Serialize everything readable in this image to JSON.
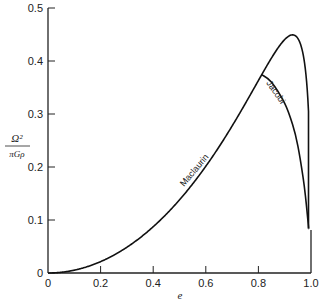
{
  "chart_data": {
    "type": "line",
    "title": "",
    "xlabel": "e",
    "ylabel": "Ω² / πGρ",
    "xlim": [
      0,
      1.0
    ],
    "ylim": [
      0,
      0.5
    ],
    "x_ticks": [
      "0",
      "0.2",
      "0.4",
      "0.6",
      "0.8",
      "1.0"
    ],
    "y_ticks": [
      "0",
      "0.1",
      "0.2",
      "0.3",
      "0.4",
      "0.5"
    ],
    "grid": false,
    "legend": "none (inline curve labels)",
    "series": [
      {
        "name": "Maclaurin",
        "x": [
          0,
          0.1,
          0.2,
          0.3,
          0.4,
          0.5,
          0.6,
          0.7,
          0.8,
          0.85,
          0.9,
          0.93,
          0.95,
          0.97,
          0.98,
          0.99
        ],
        "values": [
          0,
          0.0027,
          0.0108,
          0.0245,
          0.0445,
          0.0713,
          0.1068,
          0.1539,
          0.2178,
          0.363,
          0.4146,
          0.4492,
          0.4437,
          0.4019,
          0.3459,
          0.2605
        ]
      },
      {
        "name": "Jacobi",
        "x": [
          0.8127,
          0.85,
          0.9,
          0.93,
          0.95,
          0.97,
          0.98,
          0.99
        ],
        "values": [
          0.3742,
          0.36,
          0.32,
          0.28,
          0.24,
          0.18,
          0.14,
          0.09
        ]
      }
    ],
    "annotations": [
      "Maclaurin",
      "Jacobi"
    ]
  },
  "axis": {
    "x_label": "e",
    "y_label_num": "Ω²",
    "y_label_den": "πGρ",
    "x_ticks": [
      "0",
      "0.2",
      "0.4",
      "0.6",
      "0.8",
      "1.0"
    ],
    "y_ticks": [
      "0",
      "0.1",
      "0.2",
      "0.3",
      "0.4",
      "0.5"
    ]
  },
  "labels": {
    "maclaurin": "Maclaurin",
    "jacobi": "Jacobi"
  }
}
